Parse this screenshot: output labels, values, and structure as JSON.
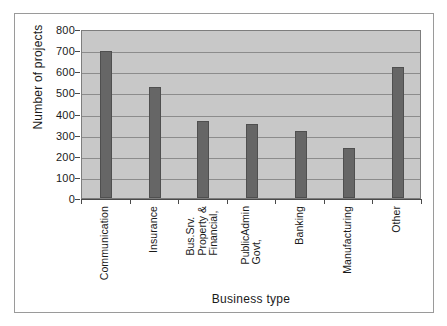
{
  "chart_data": {
    "type": "bar",
    "title": "",
    "xlabel": "Business type",
    "ylabel": "Number of projects",
    "categories": [
      "Communication",
      "Insurance",
      "Financial, Property & Bus.Srv.",
      "Govt, PublicAdmin",
      "Banking",
      "Manufacturing",
      "Other"
    ],
    "category_lines": [
      [
        "Communication"
      ],
      [
        "Insurance"
      ],
      [
        "Financial,",
        "Property &",
        "Bus.Srv."
      ],
      [
        "Govt,",
        "PublicAdmin"
      ],
      [
        "Banking"
      ],
      [
        "Manufacturing"
      ],
      [
        "Other"
      ]
    ],
    "values": [
      695,
      525,
      363,
      350,
      315,
      235,
      622
    ],
    "ylim": [
      0,
      800
    ],
    "ytick_labels": [
      "800",
      "700",
      "600",
      "500",
      "400",
      "300",
      "200",
      "100",
      "0"
    ],
    "ytick_values": [
      800,
      700,
      600,
      500,
      400,
      300,
      200,
      100,
      0
    ],
    "grid": true,
    "legend": false,
    "series_name": "Number of projects",
    "colors": {
      "bar_fill": "#666666",
      "bar_edge": "#4f4f4f",
      "plot_background": "#c8c8c8",
      "gridline": "#8c8c8c",
      "axis": "#4a4a4a",
      "frame": "#9a9a9a",
      "page_background": "#ffffff",
      "text": "#1a1a1a"
    }
  }
}
